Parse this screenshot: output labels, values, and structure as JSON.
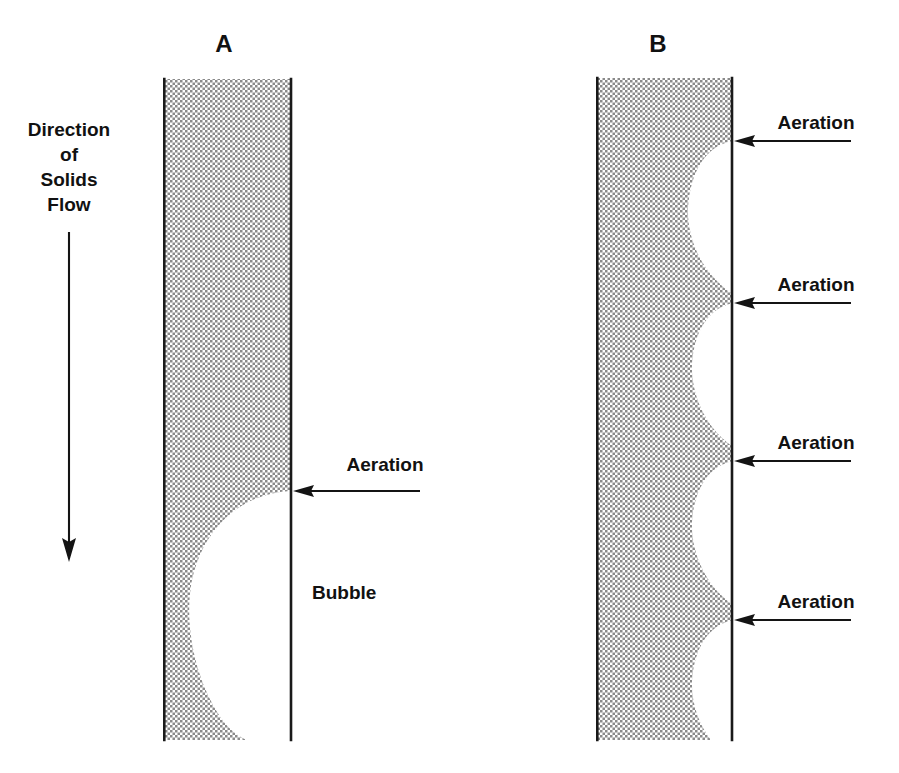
{
  "figure": {
    "background_color": "#ffffff",
    "ink_color": "#141414",
    "hatch_color": "#8c8c8c",
    "width": 899,
    "height": 773
  },
  "flow_annotation": {
    "lines": [
      "Direction",
      "of",
      "Solids",
      "Flow"
    ],
    "line1": "Direction",
    "line2": "of",
    "line3": "Solids",
    "line4": "Flow",
    "arrow_icon": "arrow-down-icon",
    "arrow_direction": "down",
    "arrow_x": 69,
    "arrow_y_start": 232,
    "arrow_y_end": 562
  },
  "panels": [
    {
      "id": "A",
      "letter": "A",
      "letter_x": 224,
      "letter_y": 44,
      "column": {
        "left": 163,
        "right": 291,
        "top": 79,
        "bottom": 740
      },
      "bubble_count": 1,
      "bubble_label": "Bubble",
      "bubble_label_x": 312,
      "bubble_label_y": 599,
      "aeration_label": "Aeration",
      "aeration_ports": [
        {
          "label": "Aeration",
          "label_x": 385,
          "label_y": 464,
          "arrow_tip_x": 293,
          "arrow_tail_x": 420,
          "arrow_y": 491,
          "arrow_icon": "arrow-left-icon"
        }
      ],
      "description": "Single large coalesced bubble occupying most of the lower standpipe"
    },
    {
      "id": "B",
      "letter": "B",
      "letter_x": 658,
      "letter_y": 44,
      "column": {
        "left": 596,
        "right": 732,
        "top": 78,
        "bottom": 740
      },
      "bubble_count": 4,
      "aeration_label": "Aeration",
      "aeration_ports": [
        {
          "label": "Aeration",
          "label_x": 816,
          "label_y": 122,
          "arrow_tip_x": 734,
          "arrow_tail_x": 851,
          "arrow_y": 141,
          "arrow_icon": "arrow-left-icon"
        },
        {
          "label": "Aeration",
          "label_x": 816,
          "label_y": 284,
          "arrow_tip_x": 734,
          "arrow_tail_x": 851,
          "arrow_y": 303,
          "arrow_icon": "arrow-left-icon"
        },
        {
          "label": "Aeration",
          "label_x": 816,
          "label_y": 442,
          "arrow_tip_x": 734,
          "arrow_tail_x": 851,
          "arrow_y": 461,
          "arrow_icon": "arrow-left-icon"
        },
        {
          "label": "Aeration",
          "label_x": 816,
          "label_y": 601,
          "arrow_tip_x": 734,
          "arrow_tail_x": 851,
          "arrow_y": 620,
          "arrow_icon": "arrow-left-icon"
        }
      ],
      "description": "Four small distributed bubbles, one at each aeration tap"
    }
  ]
}
